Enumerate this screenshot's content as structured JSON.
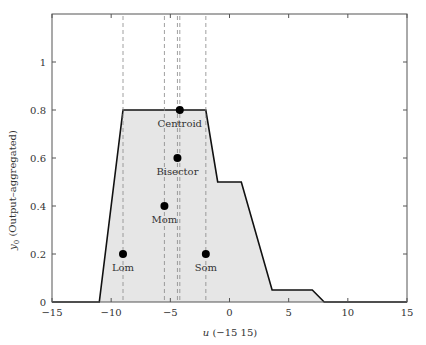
{
  "chart_data": {
    "type": "area",
    "title": "",
    "xlabel": "u (−15  15)",
    "ylabel_main": "y",
    "ylabel_sub": "0",
    "ylabel_rest": " (Output–aggregated)",
    "xlim": [
      -15,
      15
    ],
    "ylim": [
      0,
      1.2
    ],
    "xticks": [
      -15,
      -10,
      -5,
      0,
      5,
      10,
      15
    ],
    "xtick_labels": [
      "−15",
      "−10",
      "−5",
      "0",
      "5",
      "10",
      "15"
    ],
    "yticks": [
      0,
      0.2,
      0.4,
      0.6,
      0.8,
      1
    ],
    "ytick_labels": [
      "0",
      "0.2",
      "0.4",
      "0.6",
      "0.8",
      "1"
    ],
    "grid": false,
    "series": [
      {
        "name": "aggregated output",
        "x": [
          -15,
          -11,
          -9,
          -2,
          -1,
          1,
          3.6,
          7,
          8,
          15
        ],
        "y": [
          0,
          0,
          0.8,
          0.8,
          0.5,
          0.5,
          0.05,
          0.05,
          0,
          0
        ],
        "fill": "#e6e6e6",
        "line": "#111111"
      }
    ],
    "defuzz_points": [
      {
        "label": "Centroid",
        "x": -4.2,
        "y": 0.8
      },
      {
        "label": "Bisector",
        "x": -4.4,
        "y": 0.6
      },
      {
        "label": "Mom",
        "x": -5.5,
        "y": 0.4
      },
      {
        "label": "Lom",
        "x": -9,
        "y": 0.2
      },
      {
        "label": "Som",
        "x": -2,
        "y": 0.2
      }
    ],
    "dashed_lines_x": [
      -9,
      -5.5,
      -4.4,
      -4.2,
      -2
    ]
  }
}
